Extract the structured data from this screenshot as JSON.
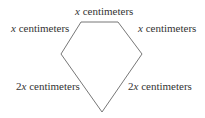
{
  "diagram": {
    "type": "pentagon",
    "stroke_color": "#777777",
    "vertices": [
      [
        81,
        22
      ],
      [
        118,
        22
      ],
      [
        142,
        54
      ],
      [
        102,
        112
      ],
      [
        61,
        54
      ]
    ],
    "labels": {
      "top": {
        "coef": "",
        "var": "x",
        "unit": " centimeters"
      },
      "upper_left": {
        "coef": "",
        "var": "x",
        "unit": " centimeters"
      },
      "upper_right": {
        "coef": "",
        "var": "x",
        "unit": " centimeters"
      },
      "lower_left": {
        "coef": "2",
        "var": "x",
        "unit": " centimeters"
      },
      "lower_right": {
        "coef": "2",
        "var": "x",
        "unit": " centimeters"
      }
    }
  }
}
